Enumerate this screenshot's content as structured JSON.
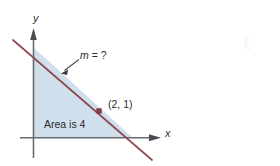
{
  "figure": {
    "title": "",
    "background_color": "#ffffff",
    "width": 280,
    "height": 166,
    "axes": {
      "y_axis_label": "y",
      "x_axis_label": "x",
      "axis_color": "#6b6b73",
      "origin": {
        "x": 33,
        "y": 138
      }
    },
    "line": {
      "color": "#8f4a52",
      "start": {
        "x": 13,
        "y": 40
      },
      "end": {
        "x": 152,
        "y": 160
      },
      "y_intercept_px": {
        "x": 33,
        "y": 47
      },
      "x_intercept_px": {
        "x": 133,
        "y": 138
      }
    },
    "region": {
      "fill_color": "#cfe0ec",
      "label": "Area is 4",
      "vertices": [
        {
          "x": 33,
          "y": 47
        },
        {
          "x": 33,
          "y": 138
        },
        {
          "x": 133,
          "y": 138
        }
      ]
    },
    "point": {
      "label": "(2, 1)",
      "marker_color": "#7e3b43",
      "position": {
        "x": 99,
        "y": 111
      }
    },
    "annotation": {
      "slope_text_italic": "m",
      "slope_text_rest": " = ?",
      "slope_text_full": "m = ?",
      "leader_from": {
        "x": 80,
        "y": 60
      },
      "leader_to": {
        "x": 62,
        "y": 73
      }
    }
  }
}
